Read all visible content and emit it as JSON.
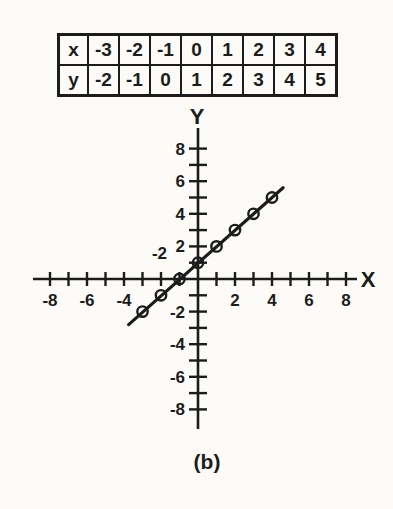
{
  "colors": {
    "ink": "#1c1c1c",
    "paper": "#fcfbf8"
  },
  "table": {
    "rows": [
      {
        "header": "x",
        "values": [
          "-3",
          "-2",
          "-1",
          "0",
          "1",
          "2",
          "3",
          "4"
        ]
      },
      {
        "header": "y",
        "values": [
          "-2",
          "-1",
          "0",
          "1",
          "2",
          "3",
          "4",
          "5"
        ]
      }
    ]
  },
  "chart_data": {
    "type": "line",
    "title": "",
    "xlabel": "X",
    "ylabel": "Y",
    "xlim": [
      -8,
      8
    ],
    "ylim": [
      -8,
      8
    ],
    "tick_step": 1,
    "grid": false,
    "legend": false,
    "x_tick_labels": [
      -8,
      -6,
      -4,
      2,
      4,
      6,
      8
    ],
    "y_tick_labels": [
      8,
      6,
      4,
      2,
      -2,
      -4,
      -6,
      -8
    ],
    "points": [
      [
        -3,
        -2
      ],
      [
        -2,
        -1
      ],
      [
        -1,
        0
      ],
      [
        0,
        1
      ],
      [
        1,
        2
      ],
      [
        2,
        3
      ],
      [
        3,
        4
      ],
      [
        4,
        5
      ]
    ],
    "line_endpoints": [
      [
        -3.75,
        -2.8
      ],
      [
        4.6,
        5.6
      ]
    ],
    "marker": "open-circle",
    "stray_label": "-2"
  },
  "caption": "(b)"
}
